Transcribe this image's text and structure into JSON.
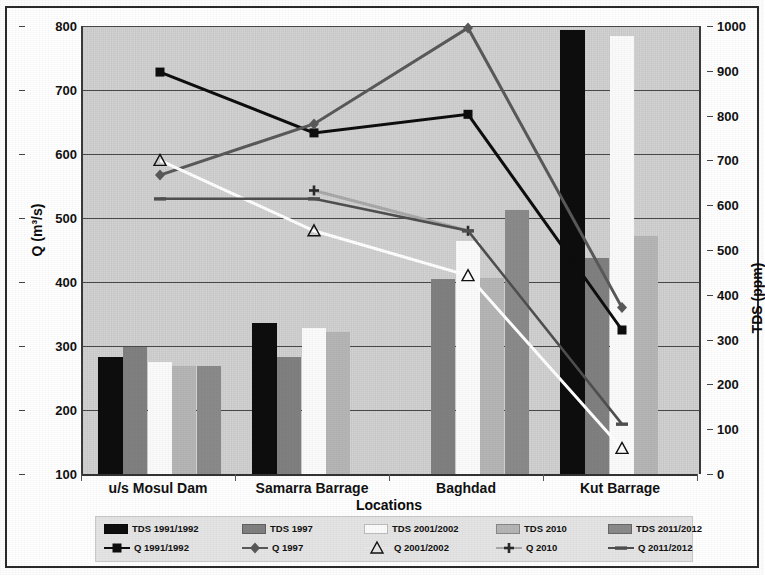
{
  "chart_data": {
    "type": "bar",
    "title": "",
    "xlabel": "Locations",
    "ylabel": "Q (m³/s)",
    "ylabel_right": "TDS (ppm)",
    "categories": [
      "u/s Mosul  Dam",
      "Samarra Barrage",
      "Baghdad",
      "Kut Barrage"
    ],
    "ylim": [
      100,
      800
    ],
    "ylim_right": [
      0,
      1000
    ],
    "yticks": [
      100,
      200,
      300,
      400,
      500,
      600,
      700,
      800
    ],
    "yticks_right": [
      0,
      100,
      200,
      300,
      400,
      500,
      600,
      700,
      800,
      900,
      1000
    ],
    "grid": true,
    "legend_position": "bottom",
    "bar_series": [
      {
        "name": "TDS 1991/1992",
        "axis": "right",
        "color": "#0d0d0d",
        "values": [
          262,
          338,
          null,
          990
        ]
      },
      {
        "name": "TDS 1997",
        "axis": "right",
        "color": "#808080",
        "values": [
          283,
          261,
          435,
          482
        ]
      },
      {
        "name": "TDS 2001/2002",
        "axis": "right",
        "color": "#fbfbfb",
        "values": [
          250,
          325,
          521,
          978
        ]
      },
      {
        "name": "TDS 2010",
        "axis": "right",
        "color": "#b5b5b5",
        "values": [
          242,
          318,
          437,
          531
        ]
      },
      {
        "name": "TDS 2011/2012",
        "axis": "right",
        "color": "#8a8a8a",
        "values": [
          240,
          null,
          589,
          null
        ]
      }
    ],
    "line_series": [
      {
        "name": "Q 1991/1992",
        "axis": "left",
        "color": "#0d0d0d",
        "marker": "square",
        "values": [
          728,
          633,
          662,
          325
        ]
      },
      {
        "name": "Q 1997",
        "axis": "left",
        "color": "#595959",
        "marker": "diamond",
        "values": [
          567,
          647,
          797,
          360
        ]
      },
      {
        "name": "Q 2001/2002",
        "axis": "left",
        "color": "#ffffff",
        "marker": "triangle",
        "values": [
          590,
          480,
          410,
          140
        ]
      },
      {
        "name": "Q 2010",
        "axis": "left",
        "color": "#a8a8a8",
        "marker": "plus",
        "values": [
          null,
          543,
          480,
          null
        ]
      },
      {
        "name": "Q 2011/2012",
        "axis": "left",
        "color": "#4f4f4f",
        "marker": "dash",
        "values": [
          530,
          530,
          480,
          178
        ]
      }
    ]
  },
  "legend": {
    "row1": [
      "TDS 1991/1992",
      "TDS 1997",
      "TDS 2001/2002",
      "TDS 2010",
      "TDS 2011/2012"
    ],
    "row2": [
      "Q 1991/1992",
      "Q 1997",
      "Q 2001/2002",
      "Q 2010",
      "Q 2011/2012"
    ]
  }
}
